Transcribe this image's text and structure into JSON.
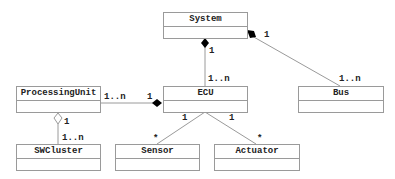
{
  "diagram": {
    "type": "uml-class-diagram",
    "classes": {
      "system": {
        "name": "System"
      },
      "ecu": {
        "name": "ECU"
      },
      "processing_unit": {
        "name": "ProcessingUnit"
      },
      "bus": {
        "name": "Bus"
      },
      "swcluster": {
        "name": "SWCluster"
      },
      "sensor": {
        "name": "Sensor"
      },
      "actuator": {
        "name": "Actuator"
      }
    },
    "relations": {
      "system_ecu": {
        "kind": "composition",
        "from": "System",
        "to": "ECU",
        "from_mult": "1",
        "to_mult": "1..n"
      },
      "system_bus": {
        "kind": "composition",
        "from": "System",
        "to": "Bus",
        "from_mult": "1",
        "to_mult": "1..n"
      },
      "ecu_processing_unit": {
        "kind": "composition",
        "from": "ECU",
        "to": "ProcessingUnit",
        "from_mult": "1",
        "to_mult": "1..n"
      },
      "processing_unit_swcluster": {
        "kind": "aggregation",
        "from": "ProcessingUnit",
        "to": "SWCluster",
        "from_mult": "1",
        "to_mult": "1..n"
      },
      "ecu_sensor": {
        "kind": "association",
        "from": "ECU",
        "to": "Sensor",
        "from_mult": "1",
        "to_mult": "*"
      },
      "ecu_actuator": {
        "kind": "association",
        "from": "ECU",
        "to": "Actuator",
        "from_mult": "1",
        "to_mult": "*"
      }
    },
    "colors": {
      "line": "#9a9a9a",
      "text": "#222222",
      "diamond_filled": "#000000",
      "diamond_hollow": "#ffffff"
    }
  }
}
